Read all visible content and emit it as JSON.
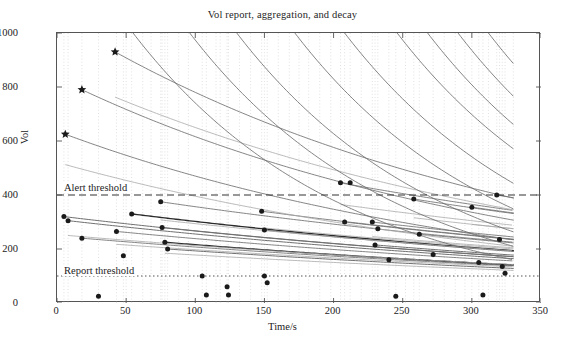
{
  "chart": {
    "title": "Vol report, aggregation, and decay",
    "xlabel": "Time/s",
    "ylabel": "Vol"
  },
  "annotations": {
    "alert_threshold_label": "Alert threshold",
    "report_threshold_label": "Report threshold"
  },
  "axis": {
    "x_ticks": [
      "0",
      "50",
      "100",
      "150",
      "200",
      "250",
      "300",
      "350"
    ],
    "y_ticks": [
      "0",
      "200",
      "400",
      "600",
      "800",
      "1000"
    ]
  },
  "chart_data": {
    "type": "line",
    "title": "Vol report, aggregation, and decay",
    "xlabel": "Time/s",
    "ylabel": "Vol",
    "xlim": [
      0,
      350
    ],
    "ylim": [
      0,
      1000
    ],
    "xticks": [
      0,
      50,
      100,
      150,
      200,
      250,
      300,
      350
    ],
    "yticks": [
      0,
      200,
      400,
      600,
      800,
      1000
    ],
    "grid": "vertical dotted gridlines at report event times",
    "legend": "none",
    "colors": {
      "curve": "#6f6f6f",
      "curve_dark": "#2b2b2b",
      "curve_light": "#a8a8a8",
      "marker": "#1a1a1a",
      "alert_threshold": "#333333",
      "report_threshold": "#555555",
      "grid": "#d9d9d9",
      "frame": "#555555"
    },
    "annotations": [
      {
        "text": "Alert threshold",
        "y": 400,
        "style": "dashed horizontal line"
      },
      {
        "text": "Report threshold",
        "y": 100,
        "style": "dotted horizontal line"
      }
    ],
    "thresholds": {
      "alert": 400,
      "report": 100
    },
    "marker_styles": {
      "star": "aggregated peak value",
      "circle": "vol report event"
    },
    "star_points": [
      {
        "x": 6,
        "y": 625
      },
      {
        "x": 18,
        "y": 790
      },
      {
        "x": 42,
        "y": 930
      }
    ],
    "report_points": [
      {
        "x": 5,
        "y": 320
      },
      {
        "x": 8,
        "y": 305
      },
      {
        "x": 18,
        "y": 240
      },
      {
        "x": 30,
        "y": 25
      },
      {
        "x": 43,
        "y": 265
      },
      {
        "x": 48,
        "y": 175
      },
      {
        "x": 50,
        "y": 120
      },
      {
        "x": 54,
        "y": 330
      },
      {
        "x": 75,
        "y": 375
      },
      {
        "x": 76,
        "y": 280
      },
      {
        "x": 78,
        "y": 225
      },
      {
        "x": 80,
        "y": 200
      },
      {
        "x": 105,
        "y": 100
      },
      {
        "x": 108,
        "y": 30
      },
      {
        "x": 123,
        "y": 60
      },
      {
        "x": 124,
        "y": 30
      },
      {
        "x": 148,
        "y": 340
      },
      {
        "x": 150,
        "y": 270
      },
      {
        "x": 150,
        "y": 100
      },
      {
        "x": 152,
        "y": 75
      },
      {
        "x": 205,
        "y": 445
      },
      {
        "x": 212,
        "y": 445
      },
      {
        "x": 208,
        "y": 300
      },
      {
        "x": 228,
        "y": 300
      },
      {
        "x": 232,
        "y": 275
      },
      {
        "x": 230,
        "y": 215
      },
      {
        "x": 240,
        "y": 160
      },
      {
        "x": 245,
        "y": 25
      },
      {
        "x": 258,
        "y": 385
      },
      {
        "x": 262,
        "y": 255
      },
      {
        "x": 272,
        "y": 180
      },
      {
        "x": 300,
        "y": 355
      },
      {
        "x": 305,
        "y": 150
      },
      {
        "x": 308,
        "y": 30
      },
      {
        "x": 318,
        "y": 400
      },
      {
        "x": 320,
        "y": 235
      },
      {
        "x": 322,
        "y": 135
      },
      {
        "x": 324,
        "y": 110
      }
    ],
    "decay_curves": [
      {
        "x0": 6,
        "y0": 625,
        "tau": 330,
        "weight": "thin"
      },
      {
        "x0": 18,
        "y0": 790,
        "tau": 330,
        "weight": "thin"
      },
      {
        "x0": 42,
        "y0": 930,
        "tau": 330,
        "weight": "thin"
      },
      {
        "x0": 5,
        "y0": 320,
        "tau": 520,
        "weight": "medium"
      },
      {
        "x0": 8,
        "y0": 305,
        "tau": 520,
        "weight": "medium"
      },
      {
        "x0": 18,
        "y0": 240,
        "tau": 560,
        "weight": "thin"
      },
      {
        "x0": 43,
        "y0": 265,
        "tau": 540,
        "weight": "thin"
      },
      {
        "x0": 54,
        "y0": 330,
        "tau": 520,
        "weight": "dark"
      },
      {
        "x0": 75,
        "y0": 375,
        "tau": 500,
        "weight": "thin"
      },
      {
        "x0": 76,
        "y0": 280,
        "tau": 520,
        "weight": "medium"
      },
      {
        "x0": 78,
        "y0": 225,
        "tau": 540,
        "weight": "dark"
      },
      {
        "x0": 80,
        "y0": 200,
        "tau": 560,
        "weight": "medium"
      },
      {
        "x0": 148,
        "y0": 340,
        "tau": 500,
        "weight": "thin"
      },
      {
        "x0": 150,
        "y0": 270,
        "tau": 520,
        "weight": "medium"
      },
      {
        "x0": 205,
        "y0": 445,
        "tau": 480,
        "weight": "thin"
      },
      {
        "x0": 208,
        "y0": 300,
        "tau": 500,
        "weight": "thin"
      },
      {
        "x0": 228,
        "y0": 300,
        "tau": 500,
        "weight": "thin"
      },
      {
        "x0": 230,
        "y0": 215,
        "tau": 520,
        "weight": "medium"
      },
      {
        "x0": 258,
        "y0": 385,
        "tau": 480,
        "weight": "thin"
      },
      {
        "x0": 262,
        "y0": 255,
        "tau": 500,
        "weight": "thin"
      },
      {
        "x0": 300,
        "y0": 355,
        "tau": 480,
        "weight": "thin"
      },
      {
        "x0": 318,
        "y0": 400,
        "tau": 470,
        "weight": "thin"
      }
    ],
    "rising_curves_from_top": [
      {
        "entry_x": 55,
        "slope": "steep"
      },
      {
        "entry_x": 96,
        "slope": "steep"
      },
      {
        "entry_x": 130,
        "slope": "steep"
      },
      {
        "entry_x": 172,
        "slope": "steep"
      },
      {
        "entry_x": 208,
        "slope": "steep"
      },
      {
        "entry_x": 246,
        "slope": "steep"
      },
      {
        "entry_x": 268,
        "slope": "steep"
      },
      {
        "entry_x": 290,
        "slope": "steep"
      },
      {
        "entry_x": 312,
        "slope": "steep"
      },
      {
        "entry_x": 330,
        "slope": "steep"
      }
    ],
    "grid_x_positions": [
      5,
      8,
      18,
      30,
      43,
      48,
      50,
      54,
      62,
      68,
      75,
      76,
      78,
      80,
      88,
      95,
      105,
      108,
      115,
      118,
      123,
      124,
      132,
      140,
      148,
      150,
      152,
      160,
      168,
      175,
      182,
      190,
      198,
      205,
      208,
      212,
      220,
      228,
      230,
      232,
      240,
      245,
      252,
      258,
      262,
      272,
      280,
      288,
      295,
      300,
      305,
      308,
      312,
      318,
      320,
      322,
      324,
      330
    ]
  }
}
